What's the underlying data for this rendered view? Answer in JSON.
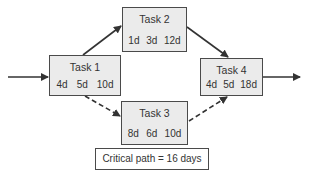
{
  "diagram": {
    "type": "critical-path network",
    "tasks": [
      {
        "id": "task1",
        "label": "Task 1",
        "durations": [
          "4d",
          "5d",
          "10d"
        ]
      },
      {
        "id": "task2",
        "label": "Task 2",
        "durations": [
          "1d",
          "3d",
          "12d"
        ]
      },
      {
        "id": "task3",
        "label": "Task 3",
        "durations": [
          "8d",
          "6d",
          "10d"
        ]
      },
      {
        "id": "task4",
        "label": "Task 4",
        "durations": [
          "4d",
          "5d",
          "18d"
        ]
      }
    ],
    "edges": [
      {
        "from": "start",
        "to": "task1",
        "style": "solid"
      },
      {
        "from": "task1",
        "to": "task2",
        "style": "solid"
      },
      {
        "from": "task2",
        "to": "task4",
        "style": "solid"
      },
      {
        "from": "task1",
        "to": "task3",
        "style": "dashed"
      },
      {
        "from": "task3",
        "to": "task4",
        "style": "dashed"
      },
      {
        "from": "task4",
        "to": "end",
        "style": "solid"
      }
    ],
    "note": "Critical path = 16 days",
    "colors": {
      "box_fill": "#ebebeb",
      "stroke": "#4a4a4a",
      "text": "#333333"
    }
  }
}
